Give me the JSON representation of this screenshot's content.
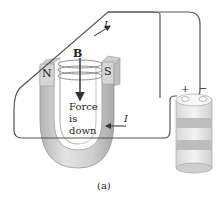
{
  "figure": {
    "caption": "(a)",
    "labels": {
      "field": "B",
      "north": "N",
      "south": "S",
      "force_line1": "Force",
      "force_line2": "is",
      "force_line3": "down",
      "current_top": "I",
      "current_bottom": "I",
      "plus": "+",
      "minus": "−"
    },
    "colors": {
      "wire": "#555555",
      "magnet_light": "#e2e2e2",
      "magnet_mid": "#c8c8c8",
      "magnet_dark": "#a8a8a8",
      "battery_band": "#b8b8b8",
      "battery_light": "#f0f0f0",
      "field_lines": "#777777"
    }
  }
}
